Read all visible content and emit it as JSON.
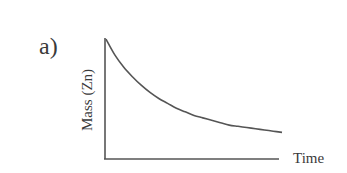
{
  "chart_data": {
    "type": "line",
    "panel_label": "a)",
    "title": "",
    "xlabel": "Time",
    "ylabel": "Mass (Zn)",
    "xticks": [],
    "yticks": [],
    "xlim": [
      0,
      1
    ],
    "ylim": [
      0,
      1
    ],
    "grid": false,
    "legend": null,
    "series": [
      {
        "name": "Mass (Zn)",
        "description": "exponential decay, qualitative (no numeric scale)",
        "x": [
          0,
          0.05,
          0.1,
          0.15,
          0.2,
          0.25,
          0.3,
          0.35,
          0.4,
          0.45,
          0.5,
          0.55,
          0.6,
          0.65,
          0.7,
          0.75,
          0.8,
          0.85,
          0.9,
          0.95,
          1.0
        ],
        "y": [
          0.99,
          0.86,
          0.76,
          0.68,
          0.61,
          0.55,
          0.5,
          0.46,
          0.42,
          0.39,
          0.36,
          0.34,
          0.32,
          0.3,
          0.28,
          0.27,
          0.26,
          0.25,
          0.24,
          0.23,
          0.22
        ]
      }
    ],
    "colors": {
      "line": "#555555",
      "text": "#3a3a3a",
      "background": "#ffffff"
    }
  }
}
